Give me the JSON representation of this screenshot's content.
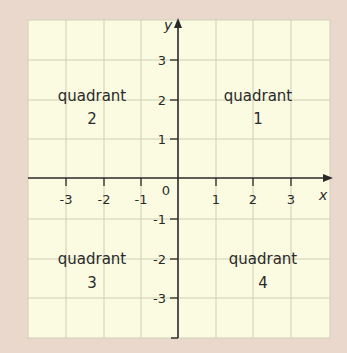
{
  "colors": {
    "page_background": "#ead8cd",
    "grid_background": "#fbfbe2",
    "grid_line": "#cfcfb5",
    "axis": "#2a2a2a",
    "text": "#2a2a2a"
  },
  "axes": {
    "x_label": "x",
    "y_label": "y",
    "origin_label": "0",
    "x_ticks": [
      "-3",
      "-2",
      "-1",
      "1",
      "2",
      "3"
    ],
    "y_ticks": [
      "3",
      "2",
      "1",
      "-1",
      "-2",
      "-3"
    ]
  },
  "quadrants": [
    {
      "word": "quadrant",
      "number": "1"
    },
    {
      "word": "quadrant",
      "number": "2"
    },
    {
      "word": "quadrant",
      "number": "3"
    },
    {
      "word": "quadrant",
      "number": "4"
    }
  ]
}
